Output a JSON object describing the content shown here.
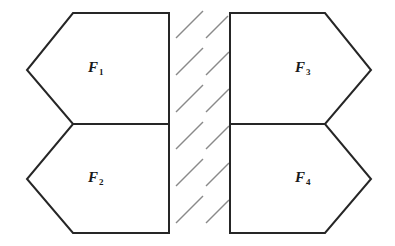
{
  "figure": {
    "background_color": "#ffffff",
    "stroke_color": "#262626",
    "hatch_color": "#8a8a8a",
    "stroke_width": 2,
    "width": 395,
    "height": 246,
    "regions": [
      {
        "id": "f1",
        "label_text": "F",
        "label_sub": "1",
        "shape": "pentagon-point-left",
        "position": "upper-left",
        "points": "73,13 169,13 169,124 73,124 27,70"
      },
      {
        "id": "f2",
        "label_text": "F",
        "label_sub": "2",
        "shape": "pentagon-point-left",
        "position": "lower-left",
        "points": "73,124 169,124 169,233 73,233 27,179"
      },
      {
        "id": "f3",
        "label_text": "F",
        "label_sub": "3",
        "shape": "pentagon-point-right",
        "position": "upper-right",
        "points": "230,13 325,13 371,70 325,124 230,124"
      },
      {
        "id": "f4",
        "label_text": "F",
        "label_sub": "4",
        "shape": "pentagon-point-right",
        "position": "lower-right",
        "points": "230,124 325,124 371,179 325,233 230,233"
      }
    ],
    "separator": {
      "name": "hatched-band",
      "description": "vertical band of short parallel diagonal hatch strokes between the left and right region pairs",
      "x_start": 170,
      "x_end": 230,
      "stroke_angle_deg": 45,
      "strokes": [
        {
          "x1": 176,
          "y1": 38,
          "x2": 203,
          "y2": 11
        },
        {
          "x1": 206,
          "y1": 38,
          "x2": 228,
          "y2": 16
        },
        {
          "x1": 176,
          "y1": 75,
          "x2": 203,
          "y2": 48
        },
        {
          "x1": 206,
          "y1": 75,
          "x2": 233,
          "y2": 48
        },
        {
          "x1": 176,
          "y1": 112,
          "x2": 203,
          "y2": 85
        },
        {
          "x1": 206,
          "y1": 112,
          "x2": 233,
          "y2": 85
        },
        {
          "x1": 176,
          "y1": 149,
          "x2": 203,
          "y2": 122
        },
        {
          "x1": 206,
          "y1": 149,
          "x2": 233,
          "y2": 122
        },
        {
          "x1": 176,
          "y1": 186,
          "x2": 203,
          "y2": 159
        },
        {
          "x1": 206,
          "y1": 186,
          "x2": 233,
          "y2": 159
        },
        {
          "x1": 176,
          "y1": 223,
          "x2": 203,
          "y2": 196
        },
        {
          "x1": 206,
          "y1": 223,
          "x2": 233,
          "y2": 196
        }
      ]
    }
  }
}
